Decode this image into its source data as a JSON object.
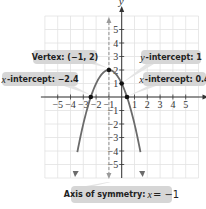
{
  "chart_data": {
    "type": "line",
    "title": "",
    "function": "f(x) = -x^2 - 2x + 1",
    "xlabel": "x",
    "ylabel": "y",
    "xlim": [
      -6,
      6
    ],
    "ylim": [
      -6,
      6
    ],
    "grid": true,
    "x_ticks": [
      -5,
      -4,
      -3,
      -2,
      -1,
      1,
      2,
      3,
      4,
      5
    ],
    "y_ticks": [
      -5,
      -4,
      -3,
      -2,
      -1,
      1,
      2,
      3,
      4,
      5
    ],
    "series": [
      {
        "name": "parabola",
        "x": [
          -3.65,
          -3,
          -2.414,
          -2,
          -1.5,
          -1,
          -0.5,
          0,
          0.414,
          1,
          1.65
        ],
        "y": [
          -6,
          -2,
          0,
          1,
          1.75,
          2,
          1.75,
          1,
          0,
          -2,
          -6
        ],
        "color": "#6b6b6b"
      }
    ],
    "points": [
      {
        "label": "Vertex",
        "x": -1,
        "y": 2
      },
      {
        "label": "y-intercept",
        "x": 0,
        "y": 1
      },
      {
        "label": "x-intercept",
        "x": -2.4,
        "y": 0
      },
      {
        "label": "x-intercept",
        "x": 0.4,
        "y": 0
      }
    ],
    "axis_of_symmetry": {
      "x": -1,
      "style": "dashed"
    },
    "annotations": [
      {
        "id": "vertex",
        "text_prefix": "",
        "text": "Vertex: (−1, 2)"
      },
      {
        "id": "y_intercept",
        "text_prefix": "y",
        "text": "-intercept: 1"
      },
      {
        "id": "x_intercept_left",
        "text_prefix": "x",
        "text": "-intercept: −2.4"
      },
      {
        "id": "x_intercept_right",
        "text_prefix": "x",
        "text": "-intercept: 0.4"
      },
      {
        "id": "axis_symmetry",
        "text": "Axis of symmetry: ",
        "italic": "x",
        "suffix": " = −1"
      }
    ]
  },
  "labels": {
    "vertex": "Vertex: (−1, 2)",
    "y_intercept_var": "y",
    "y_intercept_text": "-intercept: 1",
    "x_intercept_left_var": "x",
    "x_intercept_left_text": "-intercept: −2.4",
    "x_intercept_right_var": "x",
    "x_intercept_right_text": "-intercept: 0.4",
    "axis_symmetry_text": "Axis of symmetry: ",
    "axis_symmetry_var": "x",
    "axis_symmetry_value": " = −1",
    "x_axis_name": "x",
    "y_axis_name": "y"
  },
  "colors": {
    "curve": "#6b6b6b",
    "points": "#111111",
    "callout_fill": "#d6d6d6",
    "grid": "#e2e2e2",
    "axis": "#333333"
  }
}
